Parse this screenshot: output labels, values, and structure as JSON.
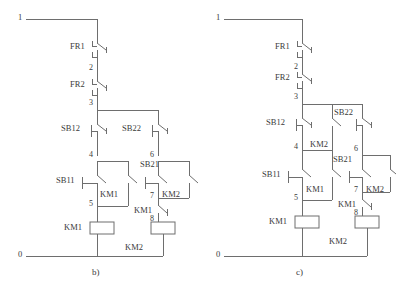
{
  "figure": {
    "line_color": "#6e6e6e",
    "text_color": "#3a3a3a",
    "background": "#ffffff"
  },
  "diagrams": [
    {
      "id": "b",
      "caption": "b)",
      "rail_top_label": "1",
      "rail_bottom_label": "0",
      "node_labels": [
        "2",
        "3",
        "4",
        "5",
        "6",
        "7",
        "8"
      ],
      "components": [
        {
          "tag": "FR1",
          "kind": "thermal-overload-nc-contact"
        },
        {
          "tag": "FR2",
          "kind": "thermal-overload-nc-contact"
        },
        {
          "tag": "SB12",
          "kind": "pushbutton-nc-contact"
        },
        {
          "tag": "SB22",
          "kind": "pushbutton-nc-contact"
        },
        {
          "tag": "SB11",
          "kind": "pushbutton-no-contact"
        },
        {
          "tag": "SB21",
          "kind": "pushbutton-no-contact"
        },
        {
          "tag": "KM1",
          "kind": "auxiliary-no-contact-seal-in"
        },
        {
          "tag": "KM2",
          "kind": "auxiliary-no-contact-seal-in"
        },
        {
          "tag": "KM1",
          "kind": "auxiliary-nc-contact-interlock"
        },
        {
          "tag": "KM1",
          "kind": "contactor-coil"
        },
        {
          "tag": "KM2",
          "kind": "contactor-coil"
        }
      ]
    },
    {
      "id": "c",
      "caption": "c)",
      "rail_top_label": "1",
      "rail_bottom_label": "0",
      "node_labels": [
        "2",
        "3",
        "4",
        "5",
        "6",
        "7",
        "8"
      ],
      "components": [
        {
          "tag": "FR1",
          "kind": "thermal-overload-nc-contact"
        },
        {
          "tag": "FR2",
          "kind": "thermal-overload-nc-contact"
        },
        {
          "tag": "SB12",
          "kind": "pushbutton-nc-contact"
        },
        {
          "tag": "SB22",
          "kind": "pushbutton-nc-contact"
        },
        {
          "tag": "SB11",
          "kind": "pushbutton-no-contact"
        },
        {
          "tag": "SB21",
          "kind": "pushbutton-no-contact"
        },
        {
          "tag": "KM2",
          "kind": "auxiliary-no-contact"
        },
        {
          "tag": "KM1",
          "kind": "auxiliary-no-contact-seal-in"
        },
        {
          "tag": "KM2",
          "kind": "auxiliary-no-contact-seal-in"
        },
        {
          "tag": "KM1",
          "kind": "auxiliary-nc-contact-interlock"
        },
        {
          "tag": "KM1",
          "kind": "contactor-coil"
        },
        {
          "tag": "KM2",
          "kind": "contactor-coil"
        }
      ]
    }
  ],
  "b": {
    "caption": "b)",
    "rail_top": "1",
    "rail_bottom": "0",
    "n2": "2",
    "n3": "3",
    "n4": "4",
    "n5": "5",
    "n6": "6",
    "n7": "7",
    "n8": "8",
    "fr1": "FR1",
    "fr2": "FR2",
    "sb12": "SB12",
    "sb22": "SB22",
    "sb11": "SB11",
    "sb21": "SB21",
    "km1_seal": "KM1",
    "km2_seal": "KM2",
    "km1_interlock": "KM1",
    "km1_coil": "KM1",
    "km2_coil": "KM2"
  },
  "c": {
    "caption": "c)",
    "rail_top": "1",
    "rail_bottom": "0",
    "n2": "2",
    "n3": "3",
    "n4": "4",
    "n5": "5",
    "n6": "6",
    "n7": "7",
    "n8": "8",
    "fr1": "FR1",
    "fr2": "FR2",
    "sb12": "SB12",
    "sb22": "SB22",
    "sb11": "SB11",
    "sb21": "SB21",
    "km2_parallel": "KM2",
    "km1_seal": "KM1",
    "km2_seal": "KM2",
    "km1_interlock": "KM1",
    "km1_coil": "KM1",
    "km2_coil": "KM2"
  }
}
